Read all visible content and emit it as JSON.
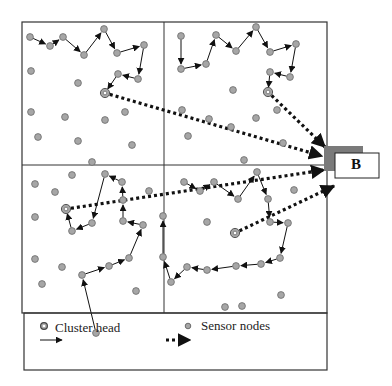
{
  "diagram": {
    "type": "wireless-sensor-network-clustering",
    "colors": {
      "node_fill": "#a6a6a6",
      "node_stroke": "#6b6b6b",
      "line": "#111111",
      "frame": "#333333",
      "base_station_shadow": "#7a7a7a"
    },
    "base_station": {
      "label": "B",
      "x": 335,
      "y": 153,
      "w": 44,
      "h": 25
    },
    "frame": {
      "x": 22,
      "y": 22,
      "w": 305,
      "h": 291,
      "mid_x": 164,
      "mid_y": 165
    },
    "legend": {
      "box": {
        "x": 24,
        "y": 313,
        "w": 303,
        "h": 57
      },
      "items": [
        {
          "icon": "cluster-head-icon",
          "label": "Cluster head"
        },
        {
          "icon": "sensor-node-icon",
          "label": "Sensor nodes"
        },
        {
          "icon": "solid-arrow-icon",
          "label": ""
        },
        {
          "icon": "dotted-arrow-icon",
          "label": ""
        }
      ]
    },
    "quadrants": [
      {
        "name": "top-left",
        "cluster_head": [
          105,
          93
        ],
        "chain": [
          [
            30,
            37
          ],
          [
            50,
            46
          ],
          [
            63,
            37
          ],
          [
            84,
            55
          ],
          [
            104,
            29
          ],
          [
            117,
            53
          ],
          [
            144,
            45
          ],
          [
            138,
            79
          ],
          [
            118,
            74
          ],
          [
            105,
            93
          ]
        ],
        "extra_nodes": [
          [
            31,
            71
          ],
          [
            78,
            83
          ],
          [
            31,
            112
          ],
          [
            65,
            117
          ],
          [
            105,
            120
          ],
          [
            125,
            112
          ],
          [
            38,
            137
          ],
          [
            78,
            141
          ],
          [
            132,
            145
          ]
        ]
      },
      {
        "name": "top-right",
        "cluster_head": [
          268,
          92
        ],
        "chain": [
          [
            181,
            36
          ],
          [
            181,
            69
          ],
          [
            206,
            64
          ],
          [
            216,
            35
          ],
          [
            236,
            51
          ],
          [
            256,
            27
          ],
          [
            270,
            52
          ],
          [
            296,
            44
          ],
          [
            290,
            77
          ],
          [
            270,
            72
          ],
          [
            268,
            92
          ]
        ],
        "extra_nodes": [
          [
            233,
            90
          ],
          [
            182,
            110
          ],
          [
            209,
            119
          ],
          [
            231,
            127
          ],
          [
            256,
            118
          ],
          [
            277,
            110
          ],
          [
            188,
            136
          ],
          [
            283,
            143
          ],
          [
            244,
            160
          ]
        ]
      },
      {
        "name": "bottom-left",
        "cluster_head": [
          66,
          209
        ],
        "chain": [
          [
            96,
            333
          ],
          [
            82,
            275
          ],
          [
            109,
            266
          ],
          [
            129,
            258
          ],
          [
            143,
            225
          ],
          [
            123,
            221
          ],
          [
            123,
            200
          ],
          [
            122,
            182
          ],
          [
            105,
            174
          ],
          [
            92,
            223
          ],
          [
            72,
            231
          ],
          [
            66,
            209
          ]
        ],
        "extra_nodes": [
          [
            92,
            162
          ],
          [
            72,
            175
          ],
          [
            35,
            184
          ],
          [
            55,
            192
          ],
          [
            35,
            217
          ],
          [
            35,
            259
          ],
          [
            62,
            267
          ],
          [
            42,
            284
          ],
          [
            136,
            291
          ],
          [
            149,
            191
          ]
        ]
      },
      {
        "name": "bottom-right",
        "cluster_head": [
          235,
          233
        ],
        "chain": [
          [
            184,
            182
          ],
          [
            200,
            191
          ],
          [
            214,
            182
          ],
          [
            238,
            199
          ],
          [
            257,
            172
          ],
          [
            268,
            199
          ],
          [
            270,
            222
          ],
          [
            288,
            223
          ],
          [
            280,
            258
          ],
          [
            261,
            264
          ],
          [
            236,
            266
          ],
          [
            207,
            270
          ],
          [
            187,
            267
          ],
          [
            171,
            282
          ],
          [
            163,
            257
          ],
          [
            163,
            216
          ]
        ],
        "extra_nodes": [
          [
            207,
            222
          ],
          [
            294,
            190
          ],
          [
            281,
            295
          ],
          [
            242,
            306
          ],
          [
            225,
            307
          ]
        ]
      }
    ],
    "dotted_links": [
      {
        "from": "top-left",
        "path": [
          [
            105,
            93
          ],
          [
            322,
            156
          ]
        ]
      },
      {
        "from": "top-right",
        "path": [
          [
            268,
            92
          ],
          [
            325,
            147
          ]
        ]
      },
      {
        "from": "bottom-left",
        "path": [
          [
            66,
            209
          ],
          [
            324,
            170
          ]
        ]
      },
      {
        "from": "bottom-right",
        "path": [
          [
            235,
            233
          ],
          [
            334,
            186
          ]
        ]
      }
    ]
  }
}
